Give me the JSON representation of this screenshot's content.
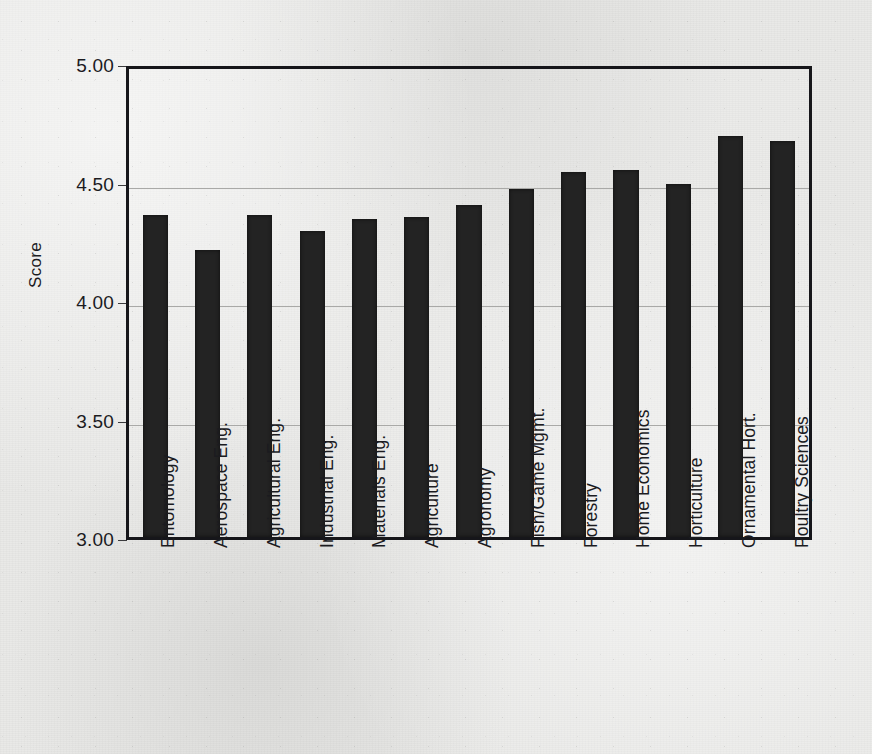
{
  "chart_data": {
    "type": "bar",
    "title": "",
    "xlabel": "",
    "ylabel": "Score",
    "ylim": [
      3.0,
      5.0
    ],
    "ytick_labels": [
      "5.00",
      "4.50",
      "4.00",
      "3.50",
      "3.00"
    ],
    "yticks": [
      5.0,
      4.5,
      4.0,
      3.5,
      3.0
    ],
    "grid": "horizontal",
    "legend": "none",
    "bar_color": "#232323",
    "categories": [
      "Entomology",
      "Aerospace Eng.",
      "Agricultural Eng.",
      "Industrial Eng.",
      "Materials Eng.",
      "Agriculture",
      "Agronomy",
      "Fish/Game Mgmt.",
      "Forestry",
      "Home Economics",
      "Horticulture",
      "Ornamental Hort.",
      "Poultry Sciences"
    ],
    "values": [
      4.36,
      4.21,
      4.36,
      4.29,
      4.34,
      4.35,
      4.4,
      4.47,
      4.54,
      4.55,
      4.49,
      4.69,
      4.67
    ]
  }
}
